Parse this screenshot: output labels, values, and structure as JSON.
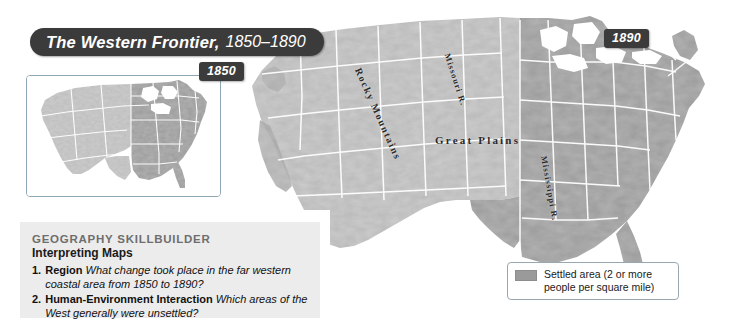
{
  "title": {
    "main": "The Western Frontier,",
    "years": "1850–1890"
  },
  "badges": {
    "inset_year": "1850",
    "main_year": "1890"
  },
  "skillbuilder": {
    "kicker": "GEOGRAPHY SKILLBUILDER",
    "subtitle": "Interpreting Maps",
    "questions": [
      {
        "num": "1.",
        "term": "Region",
        "text": "What change took place in the far western coastal area from 1850 to 1890?"
      },
      {
        "num": "2.",
        "term": "Human-Environment Interaction",
        "text": "Which areas of the West generally were unsettled?"
      }
    ]
  },
  "legend": {
    "swatch_color": "#9a9a9a",
    "label_line1": "Settled area (2 or more",
    "label_line2": "people per square mile)"
  },
  "map_labels": {
    "great_plains": "Great Plains",
    "rocky_mountains": "Rocky Mountains",
    "missouri_river": "Missouri R.",
    "mississippi_river": "Mississippi R."
  },
  "colors": {
    "title_bar": "#3b3b3b",
    "panel_bg": "#ececec",
    "settled": "#9a9a9a",
    "unsettled_terrain": "#b9b9b9",
    "state_border": "#ffffff",
    "page_bg": "#ffffff",
    "inset_border": "#8fa6b5"
  },
  "map_meta": {
    "type": "thematic-choropleth",
    "region": "Contiguous United States",
    "theme": "Settled area (population density of 2 or more people per square mile)",
    "main_map_year": "1890",
    "inset_map_year": "1850",
    "relief": "shaded terrain grayscale",
    "features_labeled": [
      "Rocky Mountains",
      "Great Plains",
      "Missouri R.",
      "Mississippi R."
    ]
  }
}
